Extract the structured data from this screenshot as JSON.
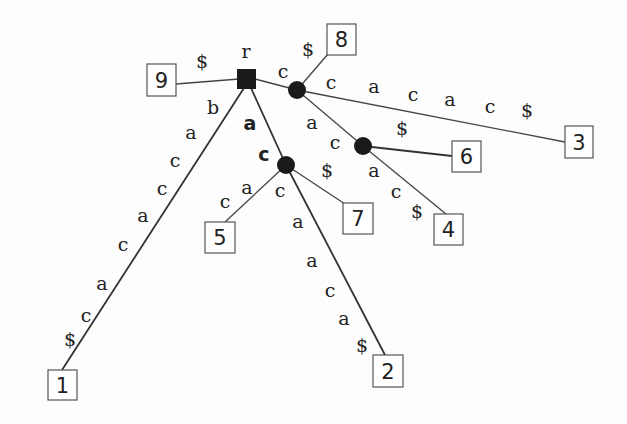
{
  "diagram": {
    "type": "suffix-tree",
    "root": {
      "label": "r",
      "shape": "square"
    },
    "internal_nodes": [
      {
        "id": "A",
        "path": "c"
      },
      {
        "id": "B",
        "path": "cac"
      },
      {
        "id": "C",
        "path": "ac"
      }
    ],
    "leaves": [
      {
        "id": "1",
        "label": "1"
      },
      {
        "id": "2",
        "label": "2"
      },
      {
        "id": "3",
        "label": "3"
      },
      {
        "id": "4",
        "label": "4"
      },
      {
        "id": "5",
        "label": "5"
      },
      {
        "id": "6",
        "label": "6"
      },
      {
        "id": "7",
        "label": "7"
      },
      {
        "id": "8",
        "label": "8"
      },
      {
        "id": "9",
        "label": "9"
      }
    ],
    "edges": [
      {
        "from": "r",
        "to": "9",
        "chars": [
          "$"
        ]
      },
      {
        "from": "r",
        "to": "1",
        "chars": [
          "b",
          "a",
          "c",
          "c",
          "a",
          "c",
          "a",
          "c",
          "$"
        ]
      },
      {
        "from": "r",
        "to": "C",
        "chars": [
          "a",
          "c"
        ],
        "bold": true
      },
      {
        "from": "r",
        "to": "A",
        "chars": [
          "c"
        ]
      },
      {
        "from": "A",
        "to": "8",
        "chars": [
          "$"
        ]
      },
      {
        "from": "A",
        "to": "3",
        "chars": [
          "c",
          "a",
          "c",
          "a",
          "c",
          "$"
        ]
      },
      {
        "from": "A",
        "to": "B",
        "chars": [
          "a",
          "c"
        ]
      },
      {
        "from": "B",
        "to": "6",
        "chars": [
          "$"
        ]
      },
      {
        "from": "B",
        "to": "4",
        "chars": [
          "a",
          "c",
          "$"
        ]
      },
      {
        "from": "C",
        "to": "5",
        "chars": [
          "c",
          "a"
        ]
      },
      {
        "from": "C",
        "to": "7",
        "chars": [
          "$"
        ]
      },
      {
        "from": "C",
        "to": "2",
        "chars": [
          "c",
          "a",
          "c",
          "a",
          "c",
          "$"
        ]
      }
    ]
  }
}
